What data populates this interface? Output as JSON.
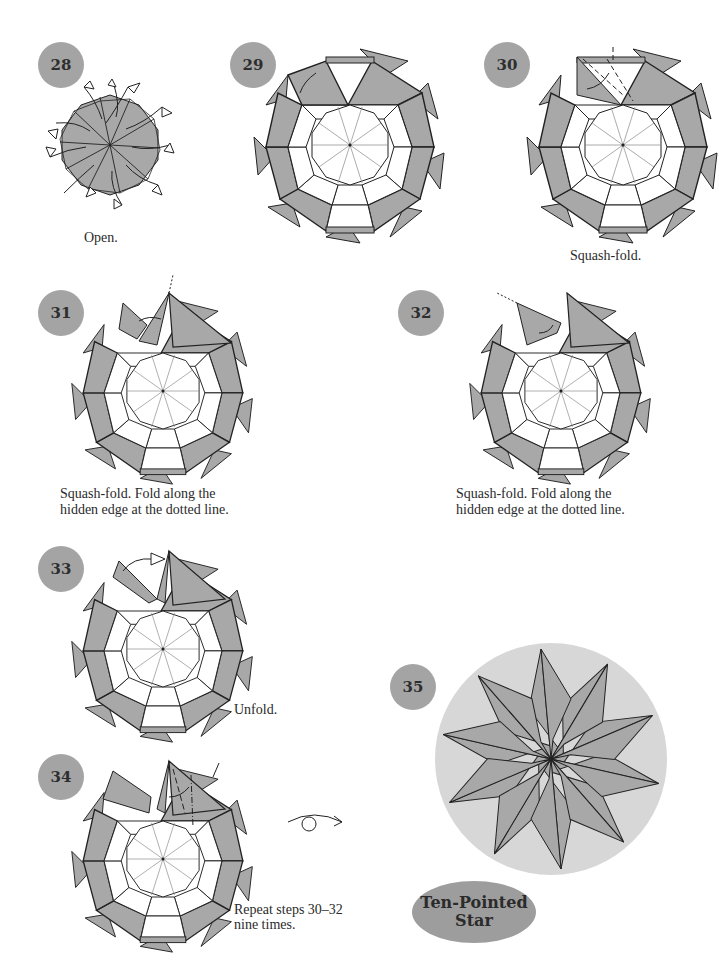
{
  "colors": {
    "paper_gray": "#a8a8a8",
    "badge_gray": "#a4a4a4",
    "final_disc": "#d7d7d7",
    "line": "#222222"
  },
  "steps": [
    {
      "number": "28",
      "caption": "Open."
    },
    {
      "number": "29",
      "caption": ""
    },
    {
      "number": "30",
      "caption": "Squash-fold."
    },
    {
      "number": "31",
      "caption": "Squash-fold. Fold along the\nhidden edge at the dotted line."
    },
    {
      "number": "32",
      "caption": "Squash-fold. Fold along the\nhidden edge at the dotted line."
    },
    {
      "number": "33",
      "caption": "Unfold."
    },
    {
      "number": "34",
      "caption": "Repeat steps 30–32\nnine times."
    },
    {
      "number": "35",
      "caption": ""
    }
  ],
  "symbols": {
    "turn_over": "turn-over-arrow-icon"
  },
  "result": {
    "title_line1": "Ten-Pointed",
    "title_line2": "Star"
  }
}
